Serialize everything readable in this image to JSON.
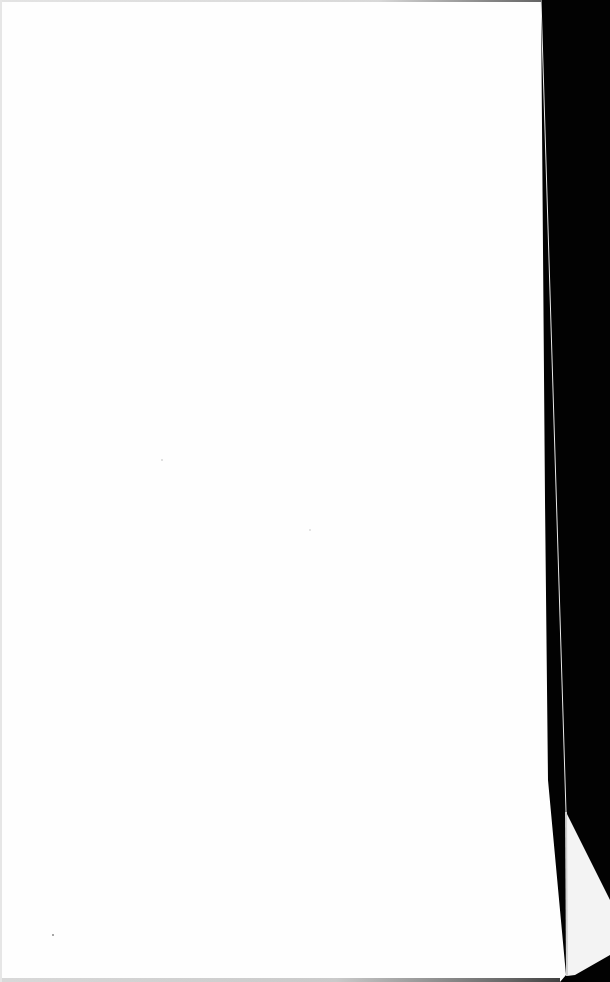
{
  "scene": {
    "description": "blank sheet of paper on black background",
    "paper_color": "#fefefe",
    "background_color": "#000000",
    "fold_color": "#f1f1f1",
    "fold_edge_color": "#cfcfcf",
    "text_content": ""
  }
}
